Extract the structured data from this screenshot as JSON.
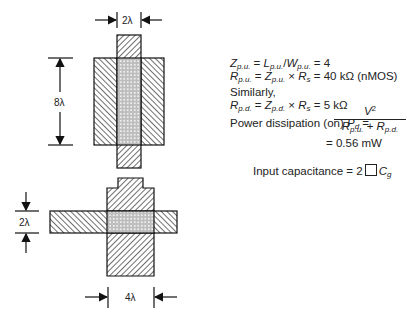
{
  "diagram": {
    "pullup_device": {
      "width_dimension": "2λ",
      "length_dimension": "8λ"
    },
    "pulldown_device": {
      "width_dimension": "2λ",
      "length_dimension": "4λ"
    }
  },
  "equations": {
    "z_pu": {
      "lhs_symbol": "Z",
      "lhs_sub": "p.u.",
      "eq": " = ",
      "num_symbol": "L",
      "num_sub": "p.u.",
      "slash": "/",
      "den_symbol": "W",
      "den_sub": "p.u.",
      "result": " = 4"
    },
    "r_pu": {
      "lhs_symbol": "R",
      "lhs_sub": "p.u.",
      "eq": " = ",
      "z_symbol": "Z",
      "z_sub": "p.u.",
      "times": " × ",
      "rs_symbol": "R",
      "rs_sub": "s",
      "result": " = 40 kΩ (nMOS)"
    },
    "similarly": "Similarly,",
    "r_pd": {
      "lhs_symbol": "R",
      "lhs_sub": "p.d.",
      "eq": " = ",
      "z_symbol": "Z",
      "z_sub": "p.d.",
      "times": " × ",
      "rs_symbol": "R",
      "rs_sub": "s",
      "result": " = 5 kΩ"
    },
    "power": {
      "label": "Power dissipation (on) ",
      "symbol": "P",
      "sub": "d",
      "eq": " = ",
      "numerator_symbol": "V",
      "numerator_sup": "2",
      "den_a_symbol": "R",
      "den_a_sub": "p.u.",
      "den_plus": " + ",
      "den_b_symbol": "R",
      "den_b_sub": "p.d.",
      "result": "= 0.56 mW"
    },
    "capacitance": {
      "label": "Input capacitance = 2",
      "symbol": "C",
      "sub": "g"
    }
  }
}
